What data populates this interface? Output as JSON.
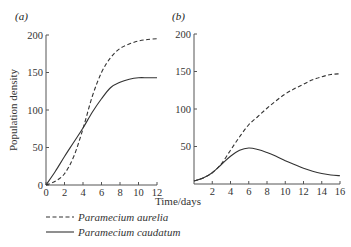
{
  "chart_data": [
    {
      "type": "line",
      "panel": "(a)",
      "xlabel": "Time/days",
      "ylabel": "Population density",
      "xlim": [
        0,
        12
      ],
      "ylim": [
        0,
        200
      ],
      "xticks": [
        0,
        2,
        4,
        6,
        8,
        10,
        12
      ],
      "yticks": [
        0,
        50,
        100,
        150,
        200
      ],
      "grid": false,
      "series": [
        {
          "name": "Paramecium aurelia",
          "style": "dashed",
          "x": [
            0,
            1,
            2,
            3,
            4,
            5,
            6,
            7,
            8,
            9,
            10,
            11,
            12
          ],
          "values": [
            0,
            5,
            15,
            38,
            75,
            118,
            150,
            170,
            182,
            188,
            192,
            194,
            195
          ]
        },
        {
          "name": "Paramecium caudatum",
          "style": "solid",
          "x": [
            0,
            1,
            2,
            3,
            4,
            5,
            6,
            7,
            8,
            9,
            10,
            11,
            12
          ],
          "values": [
            0,
            18,
            38,
            57,
            76,
            97,
            115,
            130,
            137,
            141,
            143,
            143,
            143
          ]
        }
      ]
    },
    {
      "type": "line",
      "panel": "(b)",
      "xlabel": "Time/days",
      "ylabel": "Population density",
      "xlim": [
        0,
        16
      ],
      "ylim": [
        0,
        200
      ],
      "xticks": [
        2,
        4,
        6,
        8,
        10,
        12,
        14,
        16
      ],
      "yticks": [
        50,
        100,
        150,
        200
      ],
      "grid": false,
      "series": [
        {
          "name": "Paramecium aurelia",
          "style": "dashed",
          "x": [
            0,
            1,
            2,
            3,
            4,
            5,
            6,
            7,
            8,
            9,
            10,
            11,
            12,
            13,
            14,
            15,
            16
          ],
          "values": [
            4,
            8,
            15,
            27,
            45,
            63,
            79,
            90,
            101,
            111,
            120,
            127,
            133,
            139,
            143,
            146,
            147
          ]
        },
        {
          "name": "Paramecium caudatum",
          "style": "solid",
          "x": [
            0,
            1,
            2,
            3,
            4,
            5,
            6,
            7,
            8,
            9,
            10,
            11,
            12,
            13,
            14,
            15,
            16
          ],
          "values": [
            4,
            8,
            15,
            26,
            37,
            45,
            48,
            46,
            42,
            37,
            31,
            26,
            21,
            17,
            14,
            12,
            11
          ]
        }
      ]
    }
  ],
  "labels": {
    "panel_a": "(a)",
    "panel_b": "(b)",
    "ylabel": "Population density",
    "xlabel": "Time/days"
  },
  "legend": [
    {
      "label": "Paramecium aurelia",
      "style": "dashed"
    },
    {
      "label": "Paramecium caudatum",
      "style": "solid"
    }
  ]
}
